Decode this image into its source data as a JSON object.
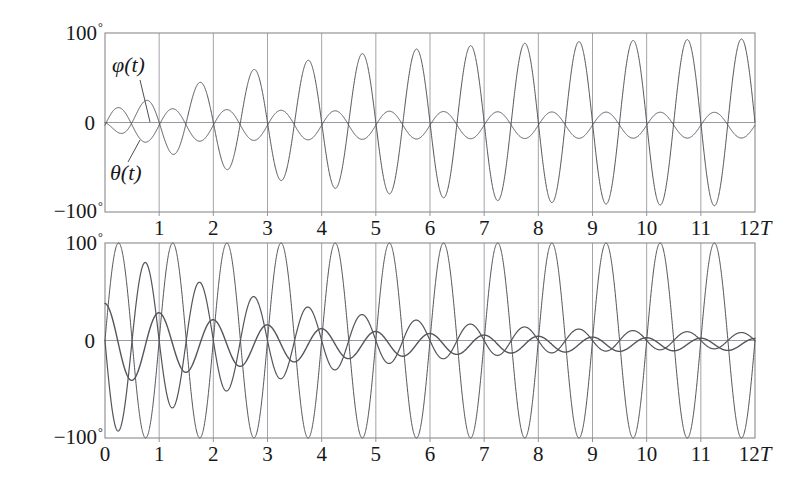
{
  "figure": {
    "background_color": "#ffffff",
    "ink_color": "#4d4d52",
    "frame_color": "#8a8a8f",
    "grid_color": "#9a9aa0",
    "text_color": "#17181a"
  },
  "annotations": {
    "phi_label": "φ(t)",
    "theta_label": "θ(t)",
    "degree_symbol": "°"
  },
  "chart_data": [
    {
      "type": "line",
      "title": "",
      "panel": "top",
      "xlabel": "12T",
      "ylabel": "",
      "xlim": [
        0,
        12
      ],
      "ylim": [
        -100,
        100
      ],
      "grid": true,
      "grid_axis": "x",
      "legend": "inline-annotation",
      "x_unit": "T",
      "x_tick_labels": [
        "1",
        "2",
        "3",
        "4",
        "5",
        "6",
        "7",
        "8",
        "9",
        "10",
        "11",
        "12T"
      ],
      "x_ticks": [
        1,
        2,
        3,
        4,
        5,
        6,
        7,
        8,
        9,
        10,
        11,
        12
      ],
      "y_tick_labels": [
        "100°",
        "0",
        "-100°"
      ],
      "y_ticks": [
        100,
        0,
        -100
      ],
      "series": [
        {
          "name": "φ(t)",
          "role": "growing-oscillation",
          "color": "#54545a",
          "linewidth": 1.0,
          "frequency_cycles_per_T": 1.0,
          "phase_deg": 180,
          "envelope": "saturating-growth",
          "envelope_start": 4,
          "envelope_final": 95,
          "envelope_rate": 0.34,
          "offset": 0,
          "amplitude_by_T": [
            4,
            22,
            40,
            55,
            66,
            75,
            81,
            86,
            89,
            91,
            93,
            94,
            95
          ]
        },
        {
          "name": "θ(t)",
          "role": "small-steady-oscillation",
          "color": "#54545a",
          "linewidth": 1.0,
          "frequency_cycles_per_T": 1.0,
          "phase_deg": 0,
          "envelope": "decaying-to-constant",
          "envelope_start": 20,
          "envelope_final": 14,
          "envelope_rate": 0.25,
          "offset": -3,
          "amplitude_by_T": [
            20,
            18,
            16,
            15,
            14,
            14,
            14,
            14,
            14,
            14,
            14,
            14,
            14
          ]
        }
      ]
    },
    {
      "type": "line",
      "title": "",
      "panel": "bottom",
      "xlabel": "12T",
      "ylabel": "",
      "xlim": [
        0,
        12
      ],
      "ylim": [
        -100,
        100
      ],
      "grid": true,
      "grid_axis": "x",
      "legend": "none",
      "x_unit": "T",
      "x_tick_labels": [
        "0",
        "1",
        "2",
        "3",
        "4",
        "5",
        "6",
        "7",
        "8",
        "9",
        "10",
        "11",
        "12T"
      ],
      "x_ticks": [
        0,
        1,
        2,
        3,
        4,
        5,
        6,
        7,
        8,
        9,
        10,
        11,
        12
      ],
      "y_tick_labels": [
        "100°",
        "0",
        "-100°"
      ],
      "y_ticks": [
        100,
        0,
        -100
      ],
      "series": [
        {
          "name": "φ(t)",
          "role": "large-sustained-oscillation",
          "color": "#54545a",
          "linewidth": 1.0,
          "frequency_cycles_per_T": 1.0,
          "phase_deg": 0,
          "envelope": "constant-full-scale",
          "envelope_start": 100,
          "envelope_final": 100,
          "offset": 0,
          "amplitude_by_T": [
            100,
            100,
            100,
            100,
            100,
            100,
            100,
            100,
            100,
            100,
            100,
            100,
            100
          ]
        },
        {
          "name": "φ(t)-partner",
          "role": "beating-decaying-oscillation",
          "color": "#54545a",
          "linewidth": 1.2,
          "frequency_cycles_per_T": 1.0,
          "phase_deg": 180,
          "envelope": "exponential-decay",
          "envelope_start": 100,
          "envelope_final": 6,
          "envelope_rate": 0.32,
          "offset": 0,
          "amplitude_by_T": [
            100,
            86,
            72,
            58,
            46,
            35,
            27,
            21,
            16,
            13,
            10,
            8,
            6
          ]
        },
        {
          "name": "θ(t)",
          "role": "modulated-decaying-oscillation",
          "color": "#54545a",
          "linewidth": 1.4,
          "frequency_cycles_per_T": 1.0,
          "phase_deg": 90,
          "envelope": "exponential-decay",
          "envelope_start": 42,
          "envelope_final": 5,
          "envelope_rate": 0.3,
          "offset": -4,
          "amplitude_by_T": [
            42,
            40,
            36,
            31,
            26,
            21,
            17,
            14,
            11,
            9,
            7,
            6,
            5
          ]
        }
      ]
    }
  ]
}
